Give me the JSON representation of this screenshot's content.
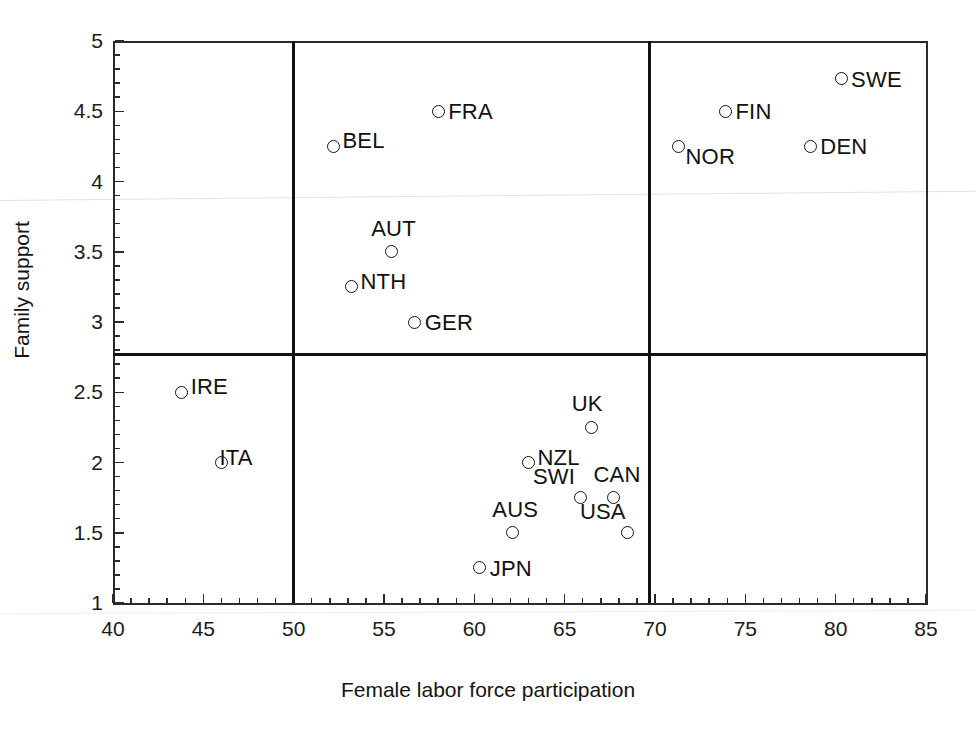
{
  "chart_data": {
    "type": "scatter",
    "title": "",
    "xlabel": "Female labor force participation",
    "ylabel": "Family support",
    "xlim": [
      40,
      85
    ],
    "ylim": [
      1,
      5
    ],
    "xticks": [
      40,
      45,
      50,
      55,
      60,
      65,
      70,
      75,
      80,
      85
    ],
    "xtick_labels": [
      "40",
      "45",
      "50",
      "55",
      "60",
      "65",
      "70",
      "75",
      "80",
      "85"
    ],
    "xminor_step": 1,
    "yticks": [
      1,
      1.5,
      2,
      2.5,
      3,
      3.5,
      4,
      4.5,
      5
    ],
    "ytick_labels": [
      "1",
      "1.5",
      "2",
      "2.5",
      "3",
      "3.5",
      "4",
      "4.5",
      "5"
    ],
    "yminor_step": 0.1,
    "grid": false,
    "legend": "none",
    "marker": "open-circle",
    "reference_lines": [
      {
        "orientation": "vertical",
        "value": 50.0
      },
      {
        "orientation": "vertical",
        "value": 69.7
      },
      {
        "orientation": "horizontal",
        "value": 2.77
      }
    ],
    "points": [
      {
        "label": "SWE",
        "x": 80.3,
        "y": 4.73,
        "label_pos": "right"
      },
      {
        "label": "FIN",
        "x": 73.9,
        "y": 4.5,
        "label_pos": "right"
      },
      {
        "label": "FRA",
        "x": 58.0,
        "y": 4.5,
        "label_pos": "right"
      },
      {
        "label": "DEN",
        "x": 78.6,
        "y": 4.25,
        "label_pos": "right"
      },
      {
        "label": "BEL",
        "x": 52.2,
        "y": 4.25,
        "label_pos": "right-up"
      },
      {
        "label": "NOR",
        "x": 71.3,
        "y": 4.25,
        "label_pos": "right-down"
      },
      {
        "label": "AUT",
        "x": 55.4,
        "y": 3.5,
        "label_pos": "above"
      },
      {
        "label": "NTH",
        "x": 53.2,
        "y": 3.25,
        "label_pos": "right-up"
      },
      {
        "label": "GER",
        "x": 56.7,
        "y": 3.0,
        "label_pos": "right"
      },
      {
        "label": "IRE",
        "x": 43.8,
        "y": 2.5,
        "label_pos": "right-up"
      },
      {
        "label": "UK",
        "x": 66.5,
        "y": 2.25,
        "label_pos": "above"
      },
      {
        "label": "ITA",
        "x": 46.0,
        "y": 2.0,
        "label_pos": "overlap-right"
      },
      {
        "label": "NZL",
        "x": 63.0,
        "y": 2.0,
        "label_pos": "right-up"
      },
      {
        "label": "CAN",
        "x": 67.7,
        "y": 1.75,
        "label_pos": "above"
      },
      {
        "label": "SWI",
        "x": 65.9,
        "y": 1.75,
        "label_pos": "below-left"
      },
      {
        "label": "AUS",
        "x": 62.1,
        "y": 1.5,
        "label_pos": "above"
      },
      {
        "label": "USA",
        "x": 68.5,
        "y": 1.5,
        "label_pos": "below-left"
      },
      {
        "label": "JPN",
        "x": 60.3,
        "y": 1.25,
        "label_pos": "right"
      }
    ]
  }
}
